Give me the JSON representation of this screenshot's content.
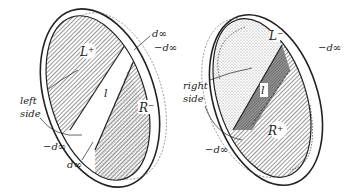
{
  "left_figure": {
    "region_top": "L⁺",
    "region_bottom": "R⁻",
    "strip": "l",
    "side_label_line1": "left",
    "side_label_line2": "side",
    "top_plus": "d∞",
    "top_minus": "−d∞",
    "bottom_minus": "−d∞",
    "bottom_plus": "d∞"
  },
  "right_figure": {
    "region_top": "L⁻",
    "region_bottom": "R⁺",
    "strip": "l",
    "side_label_line1": "right",
    "side_label_line2": "side",
    "top_minus": "−d∞",
    "bottom_minus": "−d∞"
  },
  "colors": {
    "ink": "#222222",
    "hatch": "#555555",
    "background": "#ffffff"
  }
}
